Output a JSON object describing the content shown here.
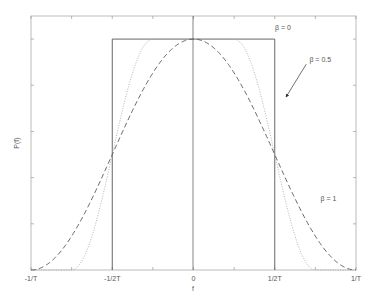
{
  "chart_data": {
    "type": "line",
    "title": "",
    "xlabel": "f",
    "ylabel": "P(f)",
    "xlim": [
      -1,
      1
    ],
    "ylim": [
      0,
      1.1
    ],
    "x_unit": "1/T",
    "x_ticks": [
      {
        "value": -1,
        "label": "-1/T"
      },
      {
        "value": -0.5,
        "label": "-1/2T"
      },
      {
        "value": 0,
        "label": "0"
      },
      {
        "value": 0.5,
        "label": "1/2T"
      },
      {
        "value": 1,
        "label": "1/T"
      }
    ],
    "y_ticks": [
      0.2,
      0.4,
      0.6,
      0.8,
      1.0
    ],
    "y_tick_labels_shown": false,
    "grid": false,
    "series": [
      {
        "name": "β = 0",
        "style": "solid",
        "color": "#555555",
        "beta": 0,
        "description": "Rectangular spectrum, 1 for |f| < 1/2T, 0 otherwise"
      },
      {
        "name": "β = 0.5",
        "style": "dotted",
        "color": "#aaaaaa",
        "beta": 0.5,
        "description": "Raised cosine, flat to |f|=1/4T, rolls off to 0 at |f|=3/4T"
      },
      {
        "name": "β = 1",
        "style": "dashed",
        "color": "#555555",
        "beta": 1,
        "description": "Full raised cosine, 0 at |f| = 1/T"
      }
    ],
    "annotations": [
      {
        "text": "β = 0",
        "x": 0.55,
        "y": 1.04
      },
      {
        "text": "β = 0.5",
        "x": 0.78,
        "y": 0.9,
        "arrow_to": [
          0.57,
          0.75
        ]
      },
      {
        "text": "β = 1",
        "x": 0.83,
        "y": 0.3
      }
    ],
    "center_line": {
      "x": 0
    }
  }
}
